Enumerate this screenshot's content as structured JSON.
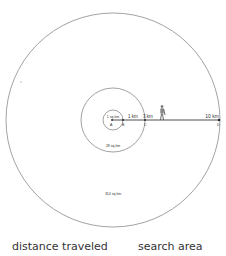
{
  "diagram": {
    "circles": [
      {
        "id": "small",
        "area_label": "1 sq km",
        "radius_label": "1 km"
      },
      {
        "id": "middle",
        "area_label": "28 sq km",
        "radius_label": "3 km"
      },
      {
        "id": "large",
        "area_label": "314 sq km",
        "radius_label": "10 km"
      }
    ],
    "points": [
      "A",
      "B",
      "C",
      "D"
    ],
    "colors": {
      "stroke": "#8a8a8a",
      "text": "#333333",
      "line": "#222222"
    }
  },
  "captions": {
    "left": "distance traveled",
    "right": "search area"
  }
}
